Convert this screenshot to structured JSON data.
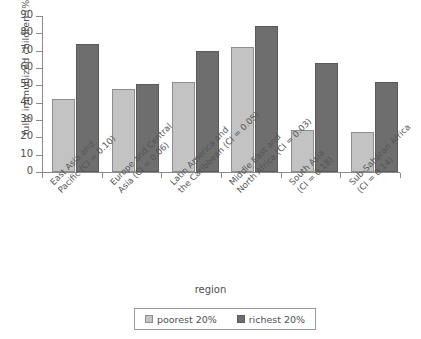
{
  "chart_data": {
    "type": "bar",
    "title": "",
    "xlabel": "region",
    "ylabel": "fully immunized children (%)",
    "ylim": [
      0,
      90
    ],
    "yticks": [
      0,
      10,
      20,
      30,
      40,
      50,
      60,
      70,
      80,
      90
    ],
    "grid": false,
    "legend_position": "bottom",
    "categories": [
      "East Asia and\nPacific (CI = 0.10)",
      "Europe and Central\nAsia (CI = 0.06)",
      "Latin America and\nthe Caribbean (CI = 0.05)",
      "Middle East and\nNorth Africa (CI = 0.03)",
      "South Asia\n(CI = 0.18)",
      "Sub-Saharan Africa\n(CI = 0.14)"
    ],
    "category_lines": [
      [
        "East Asia and",
        "Pacific (CI = 0.10)"
      ],
      [
        "Europe and Central",
        "Asia (CI = 0.06)"
      ],
      [
        "Latin America and",
        "the Caribbean (CI = 0.05)"
      ],
      [
        "Middle East and",
        "North Africa (CI = 0.03)"
      ],
      [
        "South Asia",
        "(CI = 0.18)"
      ],
      [
        "Sub-Saharan Africa",
        "(CI = 0.14)"
      ]
    ],
    "series": [
      {
        "name": "poorest 20%",
        "color": "#c3c3c3",
        "values": [
          42,
          48,
          52,
          72,
          24,
          23
        ]
      },
      {
        "name": "richest 20%",
        "color": "#6e6e6e",
        "values": [
          74,
          51,
          70,
          84,
          63,
          52
        ]
      }
    ]
  },
  "axis": {
    "y_title": "fully immunized children (%)",
    "x_title": "region",
    "y_tick_labels": [
      "90",
      "80",
      "70",
      "60",
      "50",
      "40",
      "30",
      "20",
      "10",
      "0"
    ]
  },
  "legend": {
    "items": [
      {
        "label": "poorest 20%",
        "swatch": "poorest-swatch"
      },
      {
        "label": "richest 20%",
        "swatch": "richest-swatch"
      }
    ]
  }
}
